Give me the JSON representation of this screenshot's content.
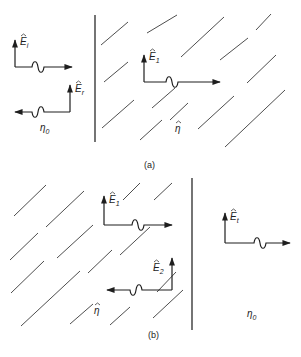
{
  "figure": {
    "panels": [
      {
        "id": "a",
        "caption": "(a)",
        "caption_pos": [
          144,
          168
        ],
        "interface": {
          "x": 95,
          "y1": 15,
          "y2": 142
        },
        "hatch_lines": [
          [
            101,
            45,
            128,
            22
          ],
          [
            104,
            82,
            128,
            62
          ],
          [
            102,
            128,
            134,
            100
          ],
          [
            140,
            140,
            162,
            120
          ],
          [
            147,
            33,
            177,
            15
          ],
          [
            152,
            108,
            175,
            88
          ],
          [
            181,
            57,
            224,
            17
          ],
          [
            170,
            120,
            188,
            103
          ],
          [
            220,
            60,
            248,
            38
          ],
          [
            247,
            83,
            276,
            55
          ],
          [
            198,
            129,
            234,
            96
          ],
          [
            225,
            147,
            285,
            90
          ],
          [
            256,
            30,
            271,
            14
          ]
        ],
        "regions": [
          {
            "medium_label": "η",
            "medium_sub": "0",
            "pos": [
              40,
              131
            ],
            "hat": false
          },
          {
            "medium_label": "η",
            "medium_sub": "",
            "pos": [
              175,
              132
            ],
            "hat": true
          }
        ],
        "vectors": [
          {
            "name": "E",
            "sub": "i",
            "corner": [
              15,
              67
            ],
            "up_to": 40,
            "h_end": 72,
            "dir": "right",
            "wave_at": 38,
            "label_pos": [
              20,
              45
            ]
          },
          {
            "name": "E",
            "sub": "r",
            "corner": [
              70,
              112
            ],
            "up_to": 85,
            "h_end": 15,
            "dir": "left",
            "wave_at": 38,
            "label_pos": [
              75,
              92
            ]
          },
          {
            "name": "E",
            "sub": "1",
            "corner": [
              144,
              82
            ],
            "up_to": 55,
            "h_end": 220,
            "dir": "right",
            "wave_at": 172,
            "label_pos": [
              149,
              60
            ]
          }
        ]
      },
      {
        "id": "b",
        "caption": "(b)",
        "caption_pos": [
          148,
          338
        ],
        "interface": {
          "x": 192,
          "y1": 178,
          "y2": 330
        },
        "hatch_lines": [
          [
            14,
            216,
            46,
            185
          ],
          [
            46,
            227,
            84,
            191
          ],
          [
            10,
            260,
            38,
            233
          ],
          [
            57,
            258,
            93,
            225
          ],
          [
            88,
            273,
            112,
            250
          ],
          [
            11,
            293,
            44,
            261
          ],
          [
            21,
            326,
            80,
            271
          ],
          [
            70,
            324,
            93,
            304
          ],
          [
            110,
            325,
            130,
            307
          ],
          [
            120,
            255,
            150,
            227
          ],
          [
            123,
            200,
            140,
            183
          ],
          [
            154,
            200,
            172,
            183
          ],
          [
            157,
            292,
            176,
            272
          ],
          [
            153,
            318,
            183,
            290
          ]
        ],
        "regions": [
          {
            "medium_label": "η",
            "medium_sub": "",
            "pos": [
              94,
              314
            ],
            "hat": true
          },
          {
            "medium_label": "η",
            "medium_sub": "0",
            "pos": [
              247,
              317
            ],
            "hat": false
          }
        ],
        "vectors": [
          {
            "name": "E",
            "sub": "1",
            "corner": [
              104,
              225
            ],
            "up_to": 196,
            "h_end": 172,
            "dir": "right",
            "wave_at": 138,
            "label_pos": [
              109,
              203
            ]
          },
          {
            "name": "E",
            "sub": "2",
            "corner": [
              172,
              290
            ],
            "up_to": 258,
            "h_end": 107,
            "dir": "left",
            "wave_at": 136,
            "label_pos": [
              153,
              271
            ]
          },
          {
            "name": "E",
            "sub": "t",
            "corner": [
              225,
              243
            ],
            "up_to": 213,
            "h_end": 290,
            "dir": "right",
            "wave_at": 260,
            "label_pos": [
              230,
              220
            ]
          }
        ]
      }
    ]
  }
}
